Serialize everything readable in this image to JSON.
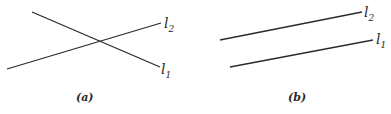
{
  "figure": {
    "panels": [
      {
        "id": "a",
        "caption": "(a)",
        "description": "intersecting lines",
        "lines": [
          {
            "name": "l1",
            "label": "l",
            "subscript": "1",
            "x1": 32,
            "y1": 12,
            "x2": 160,
            "y2": 67
          },
          {
            "name": "l2",
            "label": "l",
            "subscript": "2",
            "x1": 7,
            "y1": 69,
            "x2": 161,
            "y2": 23
          }
        ]
      },
      {
        "id": "b",
        "caption": "(b)",
        "description": "parallel lines",
        "lines": [
          {
            "name": "l2",
            "label": "l",
            "subscript": "2",
            "x1": 220,
            "y1": 40,
            "x2": 362,
            "y2": 12
          },
          {
            "name": "l1",
            "label": "l",
            "subscript": "1",
            "x1": 230,
            "y1": 67,
            "x2": 373,
            "y2": 40
          }
        ]
      }
    ],
    "colors": {
      "ink": "#2a2a2a",
      "background": "#ffffff"
    }
  }
}
